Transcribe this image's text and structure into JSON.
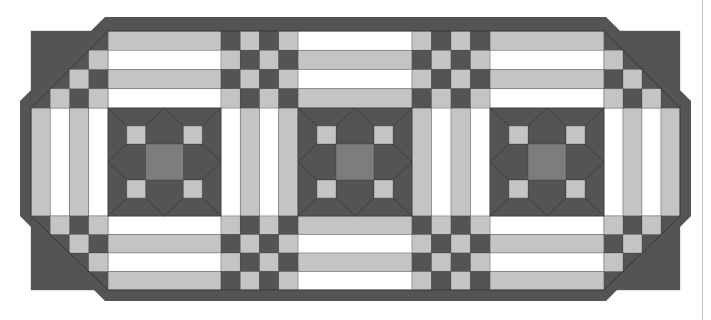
{
  "image": {
    "subject": "quilted table runner pattern diagram",
    "width": 711,
    "height": 320
  },
  "colors": {
    "background": "#ffffff",
    "dark": "#545454",
    "medium": "#7d7d7d",
    "light": "#c4c4c4",
    "white": "#ffffff",
    "seam": "#3c3c3c",
    "edge_line": "#bdbdbd"
  },
  "outer_border": {
    "points": [
      [
        105,
        17
      ],
      [
        606,
        17
      ],
      [
        691,
        101
      ],
      [
        691,
        216
      ],
      [
        606,
        301
      ],
      [
        105,
        301
      ],
      [
        20,
        216
      ],
      [
        20,
        101
      ]
    ],
    "inner_points": [
      [
        108,
        31
      ],
      [
        604,
        31
      ],
      [
        680,
        108
      ],
      [
        680,
        216
      ],
      [
        604,
        290
      ],
      [
        108,
        290
      ],
      [
        31,
        216
      ],
      [
        31,
        108
      ]
    ]
  },
  "grid": {
    "col_edges": [
      31,
      50,
      69,
      88,
      108,
      221,
      240,
      259,
      279,
      298,
      412,
      431,
      450,
      470,
      490,
      604,
      623,
      642,
      661,
      680
    ],
    "row_edges_top": [
      31,
      50,
      69,
      88,
      108
    ],
    "row_edges_bottom": [
      216,
      235,
      254,
      272,
      290
    ],
    "middle_band": [
      108,
      216
    ]
  },
  "horizontal_strip_sections": [
    {
      "name": "top-left-strips",
      "x": [
        108,
        221
      ],
      "y": [
        31,
        108
      ],
      "pattern": [
        "light",
        "white",
        "light",
        "white"
      ]
    },
    {
      "name": "top-middle-strips",
      "x": [
        298,
        412
      ],
      "y": [
        31,
        108
      ],
      "pattern": [
        "white",
        "light",
        "white",
        "light"
      ]
    },
    {
      "name": "top-right-strips",
      "x": [
        490,
        604
      ],
      "y": [
        31,
        108
      ],
      "pattern": [
        "light",
        "white",
        "light",
        "white"
      ]
    },
    {
      "name": "bottom-left-strips",
      "x": [
        108,
        221
      ],
      "y": [
        216,
        290
      ],
      "pattern": [
        "white",
        "light",
        "white",
        "light"
      ]
    },
    {
      "name": "bottom-middle-strips",
      "x": [
        298,
        412
      ],
      "y": [
        216,
        290
      ],
      "pattern": [
        "light",
        "white",
        "light",
        "white"
      ]
    },
    {
      "name": "bottom-right-strips",
      "x": [
        490,
        604
      ],
      "y": [
        216,
        290
      ],
      "pattern": [
        "white",
        "light",
        "white",
        "light"
      ]
    }
  ],
  "vertical_strip_sections": [
    {
      "name": "left-vertical-strips",
      "x": [
        31,
        108
      ],
      "y": [
        108,
        216
      ],
      "pattern": [
        "light",
        "white",
        "light",
        "white"
      ]
    },
    {
      "name": "center-left-vertical-strips",
      "x": [
        221,
        298
      ],
      "y": [
        108,
        216
      ],
      "pattern": [
        "white",
        "light",
        "white",
        "light"
      ]
    },
    {
      "name": "center-right-vertical-strips",
      "x": [
        412,
        490
      ],
      "y": [
        108,
        216
      ],
      "pattern": [
        "light",
        "white",
        "light",
        "white"
      ]
    },
    {
      "name": "right-vertical-strips",
      "x": [
        604,
        680
      ],
      "y": [
        108,
        216
      ],
      "pattern": [
        "white",
        "light",
        "white",
        "light"
      ]
    }
  ],
  "checkerboards": [
    {
      "name": "top-checker-1",
      "x0": 221,
      "y0": 31,
      "rows": [
        [
          "dark",
          "light",
          "dark",
          "light"
        ],
        [
          "light",
          "dark",
          "light",
          "dark"
        ],
        [
          "dark",
          "light",
          "dark",
          "light"
        ],
        [
          "light",
          "dark",
          "light",
          "dark"
        ]
      ]
    },
    {
      "name": "top-checker-2",
      "x0": 412,
      "y0": 31,
      "rows": [
        [
          "light",
          "dark",
          "light",
          "dark"
        ],
        [
          "dark",
          "light",
          "dark",
          "light"
        ],
        [
          "light",
          "dark",
          "light",
          "dark"
        ],
        [
          "dark",
          "light",
          "dark",
          "light"
        ]
      ]
    },
    {
      "name": "bottom-checker-1",
      "x0": 221,
      "y0": 216,
      "rows": [
        [
          "light",
          "dark",
          "light",
          "dark"
        ],
        [
          "dark",
          "light",
          "dark",
          "light"
        ],
        [
          "light",
          "dark",
          "light",
          "dark"
        ],
        [
          "dark",
          "light",
          "dark",
          "light"
        ]
      ]
    },
    {
      "name": "bottom-checker-2",
      "x0": 412,
      "y0": 216,
      "rows": [
        [
          "dark",
          "light",
          "dark",
          "light"
        ],
        [
          "light",
          "dark",
          "light",
          "dark"
        ],
        [
          "dark",
          "light",
          "dark",
          "light"
        ],
        [
          "light",
          "dark",
          "light",
          "dark"
        ]
      ]
    },
    {
      "name": "corner-checker-top-left",
      "x0": 31,
      "y0": 31,
      "rows": [
        [
          "dark",
          "dark",
          "dark",
          "dark"
        ],
        [
          "dark",
          "dark",
          "dark",
          "light"
        ],
        [
          "dark",
          "dark",
          "light",
          "dark"
        ],
        [
          "dark",
          "light",
          "dark",
          "light"
        ]
      ]
    },
    {
      "name": "corner-checker-bottom-left",
      "x0": 31,
      "y0": 216,
      "rows": [
        [
          "dark",
          "light",
          "dark",
          "light"
        ],
        [
          "dark",
          "dark",
          "light",
          "dark"
        ],
        [
          "dark",
          "dark",
          "dark",
          "light"
        ],
        [
          "dark",
          "dark",
          "dark",
          "dark"
        ]
      ]
    },
    {
      "name": "corner-checker-top-right",
      "x0": 604,
      "y0": 31,
      "rows": [
        [
          "dark",
          "dark",
          "dark",
          "dark"
        ],
        [
          "light",
          "dark",
          "dark",
          "dark"
        ],
        [
          "dark",
          "light",
          "dark",
          "dark"
        ],
        [
          "light",
          "dark",
          "light",
          "dark"
        ]
      ]
    },
    {
      "name": "corner-checker-bottom-right",
      "x0": 604,
      "y0": 216,
      "rows": [
        [
          "light",
          "dark",
          "light",
          "dark"
        ],
        [
          "dark",
          "light",
          "dark",
          "dark"
        ],
        [
          "light",
          "dark",
          "dark",
          "dark"
        ],
        [
          "dark",
          "dark",
          "dark",
          "dark"
        ]
      ]
    }
  ],
  "star_blocks": [
    {
      "name": "star-block-left",
      "x": 108,
      "y": 108,
      "w": 113,
      "h": 108
    },
    {
      "name": "star-block-center",
      "x": 298,
      "y": 108,
      "w": 114,
      "h": 108
    },
    {
      "name": "star-block-right",
      "x": 490,
      "y": 108,
      "w": 114,
      "h": 108
    }
  ],
  "cell_size": 19.3
}
